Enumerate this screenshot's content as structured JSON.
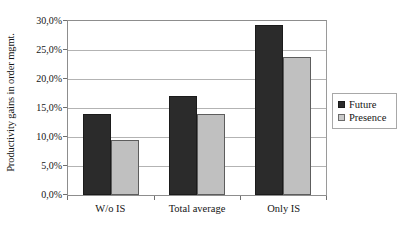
{
  "chart_data": {
    "type": "bar",
    "title": "",
    "subtitle": "",
    "xlabel": "",
    "ylabel": "Productivity gains in order mgmt.",
    "categories": [
      "W/o IS",
      "Total average",
      "Only IS"
    ],
    "series": [
      {
        "name": "Future",
        "color": "#2b2b2b",
        "values": [
          14.0,
          17.0,
          29.3
        ]
      },
      {
        "name": "Presence",
        "color": "#c0c0c0",
        "values": [
          9.5,
          14.0,
          23.8
        ]
      }
    ],
    "ylim": [
      0,
      30
    ],
    "ytick_values": [
      0,
      5,
      10,
      15,
      20,
      25,
      30
    ],
    "ytick_labels": [
      "0,0%",
      "5,0%",
      "10,0%",
      "15,0%",
      "20,0%",
      "25,0%",
      "30,0%"
    ],
    "grid": true,
    "grid_axis": "y",
    "legend_position": "right",
    "annotations": [],
    "value_suffix": "%",
    "decimal_separator": ","
  },
  "legend": {
    "items": [
      {
        "label": "Future",
        "swatch": "dark-square-swatch"
      },
      {
        "label": "Presence",
        "swatch": "light-square-swatch"
      }
    ]
  }
}
